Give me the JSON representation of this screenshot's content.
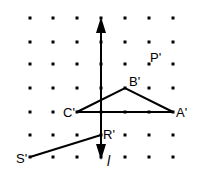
{
  "diagram": {
    "type": "reflection-grid",
    "grid": {
      "cols": 7,
      "rows": 7,
      "x0": 30,
      "y0": 18,
      "dx": 24,
      "dy": 23.4,
      "dot_color": "#000000"
    },
    "line_label": "l",
    "points": {
      "P": {
        "label": "P'",
        "col": 5,
        "row": 2
      },
      "A": {
        "label": "A'",
        "col": 7,
        "row": 4
      },
      "B": {
        "label": "B'",
        "col": 4,
        "row": 3
      },
      "C": {
        "label": "C'",
        "col": 2,
        "row": 4
      },
      "R": {
        "label": "R'",
        "col": 3,
        "row": 5
      },
      "S": {
        "label": "S'",
        "col": 0,
        "row": 6
      }
    }
  }
}
